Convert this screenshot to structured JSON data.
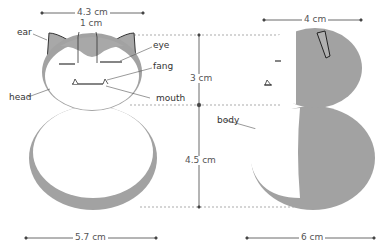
{
  "diagram": {
    "colors": {
      "gray_fur": "#9e9e9e",
      "gray_dark": "#8a8a8a",
      "white_fur": "#ffffff",
      "outline": "#333333",
      "dim_line": "#555555"
    },
    "front_view": {
      "labels": {
        "ear": "ear",
        "eye": "eye",
        "fang": "fang",
        "head": "head",
        "mouth": "mouth"
      },
      "dimensions": {
        "head_width": "4.3 cm",
        "forehead_patch": "1 cm",
        "body_width": "5.7 cm"
      }
    },
    "vertical_dimensions": {
      "head_height": "3 cm",
      "body_height": "4.5 cm"
    },
    "side_view": {
      "labels": {
        "body": "body"
      },
      "dimensions": {
        "head_depth": "4 cm",
        "body_depth": "6 cm"
      }
    }
  }
}
